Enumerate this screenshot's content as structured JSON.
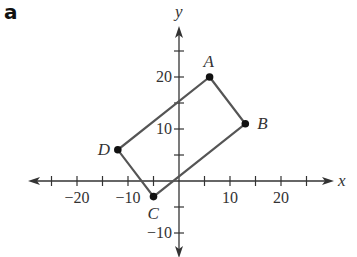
{
  "panel_label": "a",
  "axes": {
    "x_label": "x",
    "y_label": "y",
    "x_ticks": [
      -25,
      -20,
      -15,
      -10,
      -5,
      5,
      10,
      15,
      20,
      25
    ],
    "y_ticks": [
      -10,
      -5,
      5,
      10,
      15,
      20,
      25
    ],
    "x_tick_labels": [
      {
        "value": -20,
        "text": "−20"
      },
      {
        "value": -10,
        "text": "−10"
      },
      {
        "value": 10,
        "text": "10"
      },
      {
        "value": 20,
        "text": "20"
      }
    ],
    "y_tick_labels": [
      {
        "value": 20,
        "text": "20"
      },
      {
        "value": 10,
        "text": "10"
      },
      {
        "value": -10,
        "text": "−10"
      }
    ]
  },
  "points": [
    {
      "name": "A",
      "x": 6,
      "y": 20
    },
    {
      "name": "B",
      "x": 13,
      "y": 11
    },
    {
      "name": "C",
      "x": -5,
      "y": -3
    },
    {
      "name": "D",
      "x": -12,
      "y": 6
    }
  ],
  "colors": {
    "line": "#555555",
    "axis": "#333333",
    "point": "#111111"
  }
}
